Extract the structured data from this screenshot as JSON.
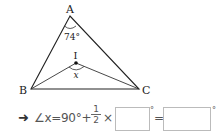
{
  "figure": {
    "vertices": {
      "A": {
        "label": "A",
        "x": 70,
        "y": 16
      },
      "B": {
        "label": "B",
        "x": 31,
        "y": 89
      },
      "C": {
        "label": "C",
        "x": 139,
        "y": 89
      },
      "I": {
        "label": "I",
        "x": 76,
        "y": 63
      }
    },
    "angle_A_label": "74°",
    "angle_I_label": "x"
  },
  "equation": {
    "arrow": "➜",
    "expression": "∠x=90°+",
    "fraction_numerator": "1",
    "fraction_denominator": "2",
    "times": "×",
    "answer_box_1": "",
    "degree_1": "°",
    "equals": "=",
    "answer_box_2": "",
    "degree_2": "°"
  }
}
